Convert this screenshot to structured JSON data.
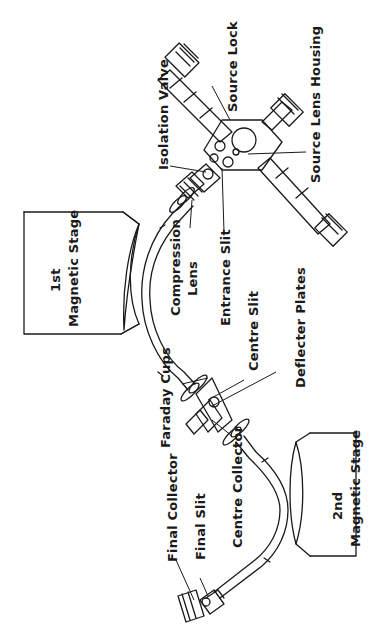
{
  "diagram": {
    "orientation": "rotated 90 degrees counter-clockwise (text reads bottom-to-top)",
    "labels": {
      "source_lock": "Source Lock",
      "source_lens_housing": "Source Lens Housing",
      "isolation_valve": "Isolation Valve",
      "entrance_slit": "Entrance Slit",
      "compression_lens_line1": "Compression",
      "compression_lens_line2": "Lens",
      "first_stage_line1": "1st",
      "first_stage_line2": "Magnetic Stage",
      "centre_slit": "Centre Slit",
      "deflecter_plates": "Deflecter Plates",
      "faraday_cups": "Faraday Cups",
      "centre_collector": "Centre Collector",
      "final_collector": "Final Collector",
      "final_slit": "Final Slit",
      "second_stage_line1": "2nd",
      "second_stage_line2": "Magnetic Stage"
    },
    "colors": {
      "ink": "#1a1a1a",
      "background": "#ffffff"
    }
  }
}
